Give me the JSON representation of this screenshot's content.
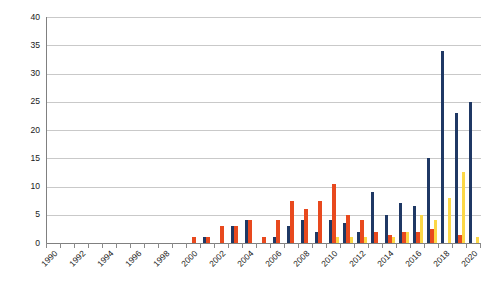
{
  "chart_data": {
    "type": "bar",
    "title": "",
    "subtitle": "",
    "xlabel": "",
    "ylabel": "",
    "ylim": [
      0,
      40
    ],
    "ytick_step": 5,
    "ytick_labels": [
      "0",
      "5",
      "10",
      "15",
      "20",
      "25",
      "30",
      "35",
      "40"
    ],
    "grid": true,
    "legend": "none",
    "orientation": "vertical",
    "xtick_labels": [
      "1990",
      "1992",
      "1994",
      "1996",
      "1998",
      "2000",
      "2002",
      "2004",
      "2006",
      "2008",
      "2010",
      "2012",
      "2014",
      "2016",
      "2018",
      "2020"
    ],
    "categories": [
      "1990",
      "1991",
      "1992",
      "1993",
      "1994",
      "1995",
      "1996",
      "1997",
      "1998",
      "1999",
      "2000",
      "2001",
      "2002",
      "2003",
      "2004",
      "2005",
      "2006",
      "2007",
      "2008",
      "2009",
      "2010",
      "2011",
      "2012",
      "2013",
      "2014",
      "2015",
      "2016",
      "2017",
      "2018",
      "2019",
      "2020"
    ],
    "colors": {
      "series_1": "#1f3864",
      "series_2": "#e8491e",
      "series_3": "#fcd745",
      "gridline": "#c9c9c9",
      "axis": "#808080",
      "background": "#ffffff",
      "text": "#1a1a1a"
    },
    "series": [
      {
        "name": "series_1",
        "color": "#1f3864",
        "values": [
          0,
          0,
          0,
          0,
          0,
          0,
          0,
          0,
          0,
          0,
          0,
          1,
          0,
          3,
          4,
          0,
          1,
          3,
          4,
          2,
          4,
          3.5,
          2,
          9,
          5,
          7,
          6.5,
          15,
          34,
          23,
          25
        ]
      },
      {
        "name": "series_2",
        "color": "#e8491e",
        "values": [
          0,
          0,
          0,
          0,
          0,
          0,
          0,
          0,
          0,
          0,
          1,
          1,
          3,
          3,
          4,
          1,
          4,
          7.5,
          6,
          7.5,
          10.5,
          5,
          4,
          2,
          1.5,
          2,
          2,
          2.5,
          0,
          1.5,
          0
        ]
      },
      {
        "name": "series_3",
        "color": "#fcd745",
        "values": [
          0,
          0,
          0,
          0,
          0,
          0,
          0,
          0,
          0,
          0,
          0,
          0,
          0,
          0,
          0,
          0,
          0,
          0,
          0,
          0,
          1,
          1,
          1,
          0,
          1,
          2,
          5,
          4,
          8,
          12.5,
          1
        ]
      }
    ]
  }
}
